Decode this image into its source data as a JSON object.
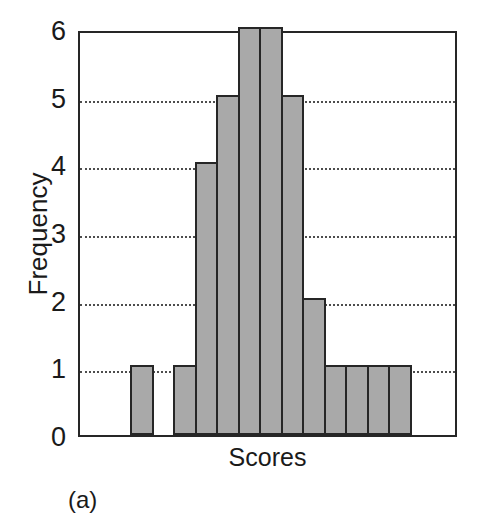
{
  "chart_data": {
    "type": "bar",
    "title": "",
    "subtitle": "",
    "xlabel": "Scores",
    "ylabel": "Frequency",
    "ylim": [
      0,
      6
    ],
    "xlim": [
      0,
      17
    ],
    "grid": true,
    "grid_axis": "y",
    "grid_style": "dotted",
    "legend": false,
    "legend_position": "none",
    "bar_fill_color": "#a9a9a9",
    "bar_edge_color": "#262626",
    "categories": [
      "bin1",
      "bin2",
      "bin3",
      "bin4",
      "bin5",
      "bin6",
      "bin7",
      "bin8",
      "bin9",
      "bin10",
      "bin11",
      "bin12",
      "bin13"
    ],
    "values": [
      1,
      0,
      1,
      4,
      5,
      6,
      6,
      5,
      2,
      1,
      1,
      1,
      1
    ],
    "y_ticks": [
      "0",
      "1",
      "2",
      "3",
      "4",
      "5",
      "6"
    ],
    "y_tick_values": [
      0,
      1,
      2,
      3,
      4,
      5,
      6
    ],
    "x_ticks": [],
    "x_tick_labels": [],
    "total_frequency": 34,
    "annotations": []
  },
  "caption": {
    "label": "(a)"
  }
}
